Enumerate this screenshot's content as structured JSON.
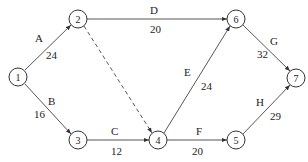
{
  "diagram": {
    "type": "activity-on-arrow network",
    "nodes": [
      {
        "id": "1",
        "label": "1",
        "x": 18,
        "y": 77
      },
      {
        "id": "2",
        "label": "2",
        "x": 78,
        "y": 19
      },
      {
        "id": "3",
        "label": "3",
        "x": 78,
        "y": 140
      },
      {
        "id": "4",
        "label": "4",
        "x": 158,
        "y": 140
      },
      {
        "id": "5",
        "label": "5",
        "x": 236,
        "y": 140
      },
      {
        "id": "6",
        "label": "6",
        "x": 236,
        "y": 19
      },
      {
        "id": "7",
        "label": "7",
        "x": 296,
        "y": 78
      }
    ],
    "edges": [
      {
        "from": "1",
        "to": "2",
        "activity": "A",
        "duration": "24",
        "dashed": false
      },
      {
        "from": "1",
        "to": "3",
        "activity": "B",
        "duration": "16",
        "dashed": false
      },
      {
        "from": "3",
        "to": "4",
        "activity": "C",
        "duration": "12",
        "dashed": false
      },
      {
        "from": "2",
        "to": "6",
        "activity": "D",
        "duration": "20",
        "dashed": false
      },
      {
        "from": "4",
        "to": "6",
        "activity": "E",
        "duration": "24",
        "dashed": false
      },
      {
        "from": "4",
        "to": "5",
        "activity": "F",
        "duration": "20",
        "dashed": false
      },
      {
        "from": "6",
        "to": "7",
        "activity": "G",
        "duration": "32",
        "dashed": false
      },
      {
        "from": "5",
        "to": "7",
        "activity": "H",
        "duration": "29",
        "dashed": false
      },
      {
        "from": "2",
        "to": "4",
        "activity": "",
        "duration": "",
        "dashed": true
      }
    ]
  }
}
